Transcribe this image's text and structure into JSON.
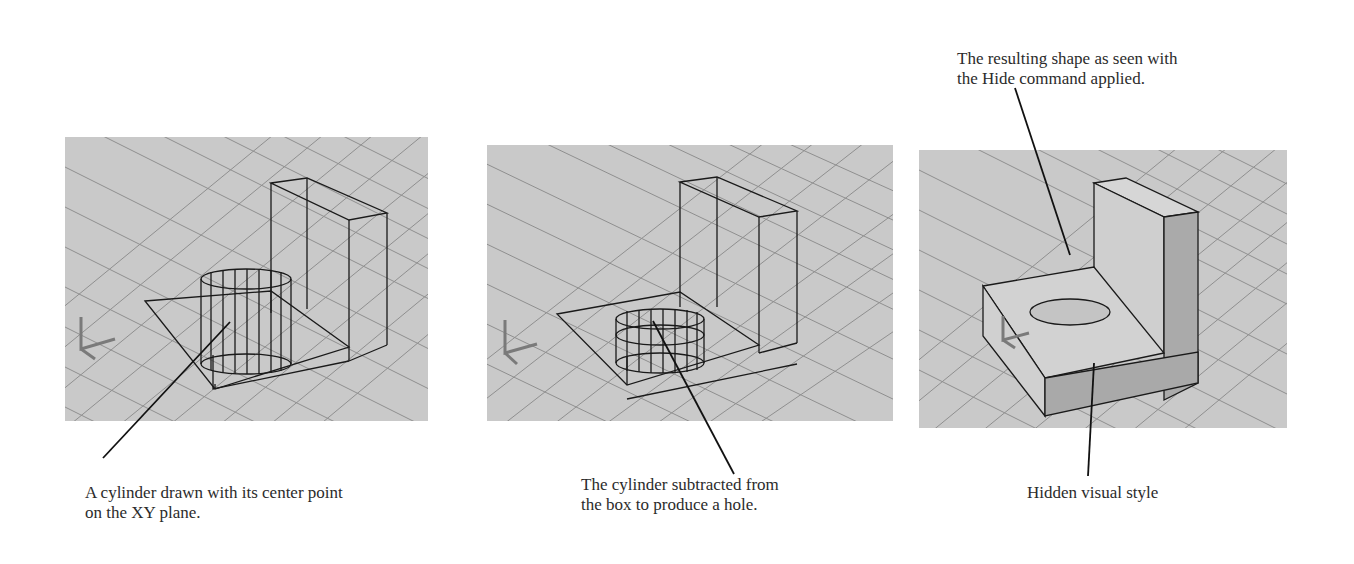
{
  "figure": {
    "panels": [
      {
        "id": "wireframe-cylinder",
        "caption_line1": "A cylinder drawn with its center point",
        "caption_line2": "on the XY plane."
      },
      {
        "id": "subtracted-hole",
        "caption_line1": "The cylinder subtracted from",
        "caption_line2": "the box to produce a hole."
      },
      {
        "id": "hidden-style",
        "caption_top_line1": "The resulting shape as seen with",
        "caption_top_line2": "the Hide command applied.",
        "caption_bottom": "Hidden visual style"
      }
    ],
    "colors": {
      "grid_background": "#c9c9c9",
      "grid_line": "#8f8f8f",
      "wire": "#1a1a1a",
      "solid_light": "#d2d2d2",
      "solid_dark": "#a9a9a9",
      "ucs_icon": "#7a7a7a"
    }
  }
}
